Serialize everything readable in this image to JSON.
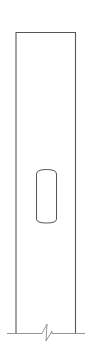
{
  "diagram": {
    "type": "elevation-drawing",
    "colors": {
      "background": "#ffffff",
      "stroke": "#555555",
      "light_stroke": "#888888"
    },
    "elements": {
      "panel": {
        "x": 15,
        "y": 32,
        "width": 60,
        "height": 301
      },
      "slot": {
        "x": 36,
        "y": 169,
        "width": 20,
        "height": 54,
        "corner_radius": 4
      },
      "ground_line": {
        "x1": 7,
        "x2": 85,
        "y": 333
      },
      "break_symbol": {
        "cx": 47,
        "cy": 333
      }
    }
  }
}
